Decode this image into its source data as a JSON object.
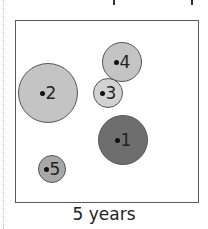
{
  "diagram": {
    "caption": "5 years",
    "colors": {
      "frame": "#5a5a5a",
      "light_bubble": "#c4c4c4",
      "mid_bubble": "#b0b0b0",
      "dark_bubble": "#6e6e6e",
      "stroke": "#555555"
    },
    "bubbles": [
      {
        "id": "1",
        "label": "1",
        "cx": 123,
        "cy": 140,
        "r": 25,
        "fill": "#6e6e6e"
      },
      {
        "id": "2",
        "label": "2",
        "cx": 48,
        "cy": 93,
        "r": 30,
        "fill": "#c4c4c4"
      },
      {
        "id": "3",
        "label": "3",
        "cx": 108,
        "cy": 93,
        "r": 15,
        "fill": "#d2d2d2"
      },
      {
        "id": "4",
        "label": "4",
        "cx": 122,
        "cy": 62,
        "r": 20,
        "fill": "#c4c4c4"
      },
      {
        "id": "5",
        "label": "5",
        "cx": 52,
        "cy": 169,
        "r": 14,
        "fill": "#a8a8a8"
      }
    ]
  }
}
